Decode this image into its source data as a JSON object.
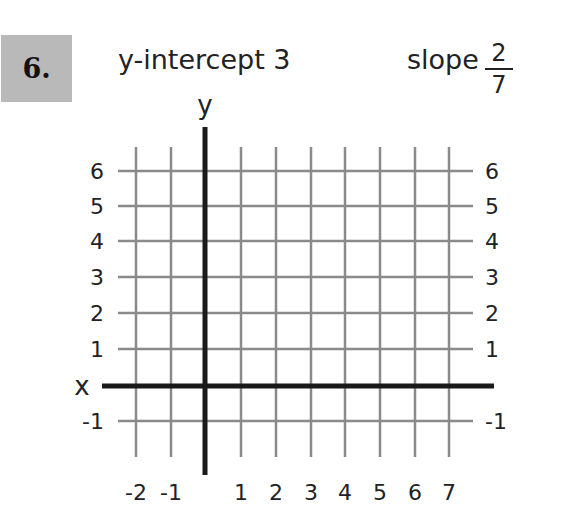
{
  "problem": {
    "number": "6.",
    "y_intercept_label": "y-intercept 3",
    "slope_label": "slope",
    "slope_numerator": "2",
    "slope_denominator": "7"
  },
  "graph": {
    "x_axis_label": "x",
    "y_axis_label": "y",
    "x_ticks": [
      "-2",
      "-1",
      "1",
      "2",
      "3",
      "4",
      "5",
      "6",
      "7"
    ],
    "y_ticks_left": [
      "6",
      "5",
      "4",
      "3",
      "2",
      "1",
      "-1"
    ],
    "y_ticks_right": [
      "6",
      "5",
      "4",
      "3",
      "2",
      "1",
      "-1"
    ],
    "x_range": [
      -2,
      7
    ],
    "y_range": [
      -1,
      6
    ],
    "grid": true,
    "colors": {
      "grid": "#8a8a8a",
      "axis": "#1a1a1a",
      "number_box": "#b9b9b9"
    }
  }
}
